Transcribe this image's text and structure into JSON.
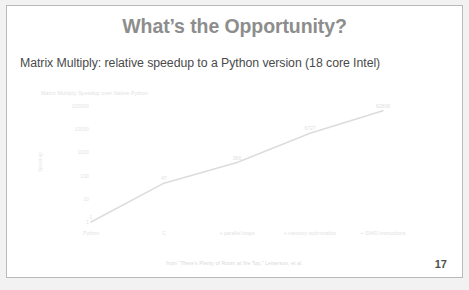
{
  "slide": {
    "title": "What’s the Opportunity?",
    "subtitle": "Matrix Multiply: relative speedup to a Python version (18 core Intel)",
    "source_note": "from  “There’s Plenty of Room at the Top,” Leiserson, et al.",
    "page_number": "17"
  },
  "colors": {
    "title": "#8d8d8d",
    "subtitle": "#4a4a4a",
    "chart_line": "#dcdcdc",
    "chart_text": "#e2e2e2",
    "page_number": "#4f4f4f",
    "slide_border": "#b9b9b9",
    "canvas_background": "#f2f2f2"
  },
  "chart_data": {
    "type": "line",
    "title": "Matrix Multiply Speedup over Native Python",
    "xlabel": "",
    "ylabel": "Speed-up",
    "yscale": "log",
    "ylim": [
      1,
      100000
    ],
    "grid": false,
    "legend": "none",
    "categories": [
      "Python",
      "C",
      "+ parallel loops",
      "+ memory optimization",
      "+ SIMD instructions"
    ],
    "ytick_labels": [
      "100000",
      "10000",
      "1000",
      "100",
      "10",
      "1"
    ],
    "values": [
      1,
      47,
      366,
      6727,
      62806
    ],
    "point_labels": [
      "1",
      "47",
      "366",
      "6727",
      "62806"
    ],
    "series": [
      {
        "name": "Speed-up over native Python",
        "values": [
          1,
          47,
          366,
          6727,
          62806
        ]
      }
    ]
  }
}
